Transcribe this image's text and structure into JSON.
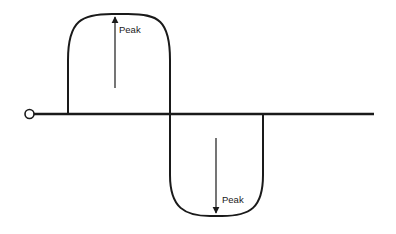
{
  "diagram": {
    "labels": {
      "positive_peak": "Peak",
      "negative_peak": "Peak"
    },
    "colors": {
      "line": "#1a1a1a",
      "background": "#ffffff"
    }
  }
}
